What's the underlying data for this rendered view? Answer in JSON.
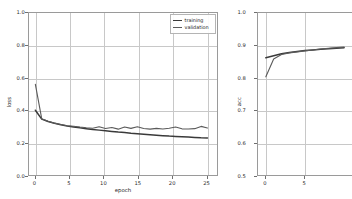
{
  "figure": {
    "background": "#ffffff",
    "width": 322,
    "height": 199,
    "grid_color": "#c8c8c8",
    "frame_color": "#9a9a9a"
  },
  "legend": {
    "position": "upper right of loss panel",
    "items": [
      {
        "label": "training",
        "color": "#3a3a3a",
        "icon": "line-swatch-icon"
      },
      {
        "label": "validation",
        "color": "#5a5a5a",
        "icon": "line-swatch-icon"
      }
    ]
  },
  "chart_data": [
    {
      "id": "loss-chart",
      "type": "line",
      "title": "",
      "xlabel": "epoch",
      "ylabel": "loss",
      "xlim": [
        -1,
        28.5
      ],
      "ylim": [
        0.0,
        1.0
      ],
      "xticks": [
        0,
        5,
        10,
        15,
        20,
        25
      ],
      "xtick_labels": [
        "0",
        "5",
        "10",
        "15",
        "20",
        "25"
      ],
      "yticks": [
        0.0,
        0.2,
        0.4,
        0.6,
        0.8,
        1.0
      ],
      "ytick_labels": [
        "0.0",
        "0.2",
        "0.4",
        "0.6",
        "0.8",
        "1.0"
      ],
      "grid": true,
      "legend_position": "upper right",
      "x": [
        0,
        1,
        2,
        3,
        4,
        5,
        6,
        7,
        8,
        9,
        10,
        11,
        12,
        13,
        14,
        15,
        16,
        17,
        18,
        19,
        20,
        21,
        22,
        23,
        24,
        25,
        26,
        27
      ],
      "series": [
        {
          "name": "training",
          "color": "#3a3a3a",
          "values": [
            0.4,
            0.345,
            0.33,
            0.319,
            0.31,
            0.303,
            0.297,
            0.291,
            0.286,
            0.281,
            0.277,
            0.273,
            0.269,
            0.265,
            0.262,
            0.258,
            0.255,
            0.252,
            0.249,
            0.246,
            0.243,
            0.24,
            0.238,
            0.236,
            0.234,
            0.232,
            0.23,
            0.229
          ]
        },
        {
          "name": "validation",
          "color": "#5a5a5a",
          "values": [
            0.56,
            0.347,
            0.332,
            0.32,
            0.312,
            0.304,
            0.301,
            0.296,
            0.292,
            0.289,
            0.298,
            0.287,
            0.293,
            0.283,
            0.296,
            0.288,
            0.298,
            0.287,
            0.283,
            0.288,
            0.284,
            0.289,
            0.296,
            0.285,
            0.284,
            0.286,
            0.3,
            0.29
          ]
        }
      ]
    },
    {
      "id": "acc-chart",
      "type": "line",
      "title": "",
      "xlabel": "epoch",
      "ylabel": "acc",
      "xlim": [
        -1,
        11
      ],
      "ylim": [
        0.5,
        1.0
      ],
      "xticks": [
        0,
        5
      ],
      "xtick_labels": [
        "0",
        "5"
      ],
      "yticks": [
        0.5,
        0.6,
        0.7,
        0.8,
        0.9,
        1.0
      ],
      "ytick_labels": [
        "0.5",
        "0.6",
        "0.7",
        "0.8",
        "0.9",
        "1.0"
      ],
      "grid": true,
      "note": "panel clipped by right edge of figure",
      "x": [
        0,
        1,
        2,
        3,
        4,
        5,
        6,
        7,
        8,
        9,
        10
      ],
      "series": [
        {
          "name": "training",
          "color": "#3a3a3a",
          "values": [
            0.862,
            0.868,
            0.874,
            0.878,
            0.881,
            0.884,
            0.886,
            0.888,
            0.89,
            0.891,
            0.893
          ]
        },
        {
          "name": "validation",
          "color": "#5a5a5a",
          "values": [
            0.803,
            0.858,
            0.872,
            0.877,
            0.88,
            0.883,
            0.886,
            0.889,
            0.891,
            0.893,
            0.895
          ]
        }
      ]
    }
  ]
}
